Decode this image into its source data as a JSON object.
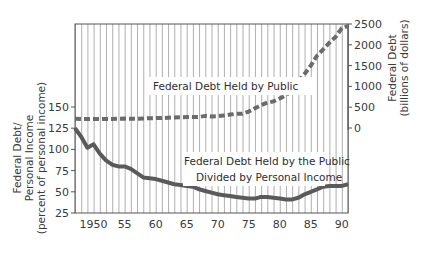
{
  "chart_data": {
    "type": "line",
    "title": "",
    "xlabel": "",
    "x_tick_labels": [
      "1950",
      "55",
      "60",
      "65",
      "70",
      "75",
      "80",
      "85",
      "90"
    ],
    "x_ticks": [
      1950,
      1955,
      1960,
      1965,
      1970,
      1975,
      1980,
      1985,
      1990
    ],
    "xlim": [
      1947,
      1991
    ],
    "grid": "vertical lines each year",
    "left_axis": {
      "label_lines": [
        "Federal Debt/",
        "Personal Income",
        "(percent of personal income)"
      ],
      "ticks": [
        25,
        50,
        75,
        100,
        125,
        150
      ],
      "ylim": [
        25,
        150
      ]
    },
    "right_axis": {
      "label_lines": [
        "Federal Debt",
        "(billions of dollars)"
      ],
      "ticks": [
        0,
        500,
        1000,
        1500,
        2000,
        2500
      ],
      "ylim": [
        0,
        2500
      ]
    },
    "annotations": [
      {
        "text": "Federal Debt Held by Public",
        "series": "debt_billions"
      },
      {
        "text_lines": [
          "Federal Debt Held by the Public",
          "Divided by Personal Income"
        ],
        "series": "debt_pct_income"
      }
    ],
    "series": [
      {
        "name": "Federal Debt Held by Public",
        "axis": "right",
        "style": "dashed",
        "color": "#6b6b6b",
        "x": [
          1947,
          1948,
          1949,
          1950,
          1951,
          1952,
          1953,
          1954,
          1955,
          1956,
          1957,
          1958,
          1959,
          1960,
          1961,
          1962,
          1963,
          1964,
          1965,
          1966,
          1967,
          1968,
          1969,
          1970,
          1971,
          1972,
          1973,
          1974,
          1975,
          1976,
          1977,
          1978,
          1979,
          1980,
          1981,
          1982,
          1983,
          1984,
          1985,
          1986,
          1987,
          1988,
          1989,
          1990,
          1991
        ],
        "values": [
          224,
          216,
          214,
          219,
          214,
          215,
          218,
          224,
          227,
          222,
          219,
          226,
          235,
          237,
          238,
          248,
          254,
          257,
          261,
          264,
          267,
          290,
          278,
          283,
          303,
          322,
          341,
          344,
          395,
          477,
          549,
          607,
          640,
          710,
          785,
          919,
          1131,
          1300,
          1500,
          1737,
          1889,
          2051,
          2190,
          2400,
          2450
        ]
      },
      {
        "name": "Federal Debt Held by the Public Divided by Personal Income",
        "axis": "left",
        "style": "solid",
        "color": "#5a5a5a",
        "x": [
          1947,
          1948,
          1949,
          1950,
          1951,
          1952,
          1953,
          1954,
          1955,
          1956,
          1957,
          1958,
          1959,
          1960,
          1961,
          1962,
          1963,
          1964,
          1965,
          1966,
          1967,
          1968,
          1969,
          1970,
          1971,
          1972,
          1973,
          1974,
          1975,
          1976,
          1977,
          1978,
          1979,
          1980,
          1981,
          1982,
          1983,
          1984,
          1985,
          1986,
          1987,
          1988,
          1989,
          1990,
          1991
        ],
        "values": [
          125,
          115,
          102,
          106,
          95,
          87,
          82,
          80,
          80,
          77,
          72,
          67,
          66,
          65,
          63,
          61,
          59,
          58,
          57,
          56,
          53,
          51,
          49,
          47,
          46,
          45,
          44,
          43,
          42,
          42,
          44,
          44,
          43,
          42,
          41,
          41,
          43,
          47,
          50,
          53,
          56,
          57,
          57,
          57,
          59
        ]
      }
    ]
  },
  "caption_fragment": "g"
}
